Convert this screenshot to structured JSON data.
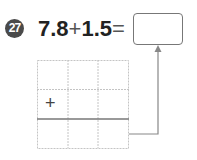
{
  "problem": {
    "number": "27",
    "operand1": "7.8",
    "operator": "+",
    "operand2": "1.5",
    "equals": "=",
    "answer": ""
  },
  "grid": {
    "rows": 3,
    "cols": 3,
    "operator_symbol": "+"
  },
  "colors": {
    "badge": "#4a4a4a",
    "text": "#222222",
    "grid_line": "#bbbbbb",
    "result_line": "#777777",
    "arrow": "#888888"
  }
}
